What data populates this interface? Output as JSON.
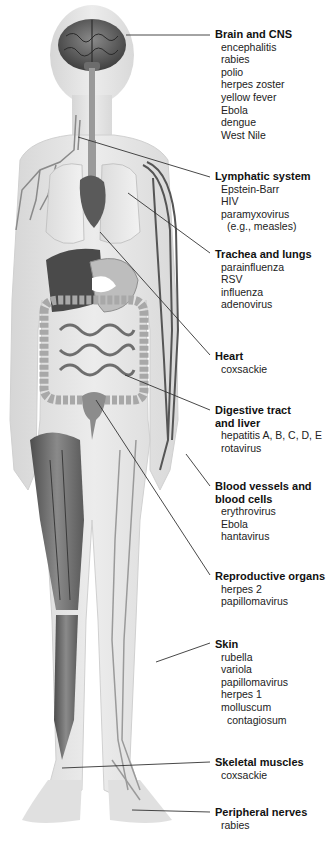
{
  "figure": {
    "type": "anatomical-diagram",
    "colors": {
      "background": "#ffffff",
      "body_silhouette": "#e6e6e6",
      "organ_dark": "#5a5a5a",
      "organ_mid": "#8c8c8c",
      "organ_light": "#c8c8c8",
      "leader_line": "#333333",
      "text": "#1a1a1a"
    }
  },
  "labels": [
    {
      "title": "Brain and CNS",
      "items": [
        "encephalitis",
        "rabies",
        "polio",
        "herpes zoster",
        "yellow fever",
        "Ebola",
        "dengue",
        "West Nile"
      ]
    },
    {
      "title": "Lymphatic system",
      "items": [
        "Epstein-Barr",
        "HIV",
        "paramyxovirus",
        "(e.g., measles)"
      ]
    },
    {
      "title": "Trachea and lungs",
      "items": [
        "parainfluenza",
        "RSV",
        "influenza",
        "adenovirus"
      ]
    },
    {
      "title": "Heart",
      "items": [
        "coxsackie"
      ]
    },
    {
      "title_lines": [
        "Digestive tract",
        "and liver"
      ],
      "items": [
        "hepatitis A, B, C, D, E",
        "rotavirus"
      ]
    },
    {
      "title_lines": [
        "Blood vessels and",
        "blood cells"
      ],
      "items": [
        "erythrovirus",
        "Ebola",
        "hantavirus"
      ]
    },
    {
      "title": "Reproductive organs",
      "items": [
        "herpes 2",
        "papillomavirus"
      ]
    },
    {
      "title": "Skin",
      "items": [
        "rubella",
        "variola",
        "papillomavirus",
        "herpes 1",
        "molluscum",
        "contagiosum"
      ]
    },
    {
      "title": "Skeletal muscles",
      "items": [
        "coxsackie"
      ]
    },
    {
      "title": "Peripheral nerves",
      "items": [
        "rabies"
      ]
    }
  ]
}
